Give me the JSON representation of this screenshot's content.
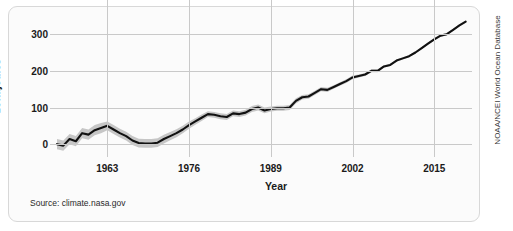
{
  "card": {
    "source_note": "Source: climate.nasa.gov",
    "credit_note": "NOAA/NCEI World Ocean Database"
  },
  "chart_data": {
    "type": "line",
    "title": "",
    "xlabel": "Year",
    "ylabel": "zettajoules",
    "xlim": [
      1955,
      2021
    ],
    "ylim": [
      -35,
      355
    ],
    "grid": true,
    "legend": "none",
    "xticks": [
      1963,
      1976,
      1989,
      2002,
      2015
    ],
    "xtick_labels": [
      "1963",
      "1976",
      "1989",
      "2002",
      "2015"
    ],
    "yticks": [
      0,
      100,
      200,
      300
    ],
    "ytick_labels": [
      "0",
      "100",
      "200",
      "300"
    ],
    "series": [
      {
        "name": "Ocean heat content",
        "color": "#111111",
        "x": [
          1955,
          1956,
          1957,
          1958,
          1959,
          1960,
          1961,
          1962,
          1963,
          1964,
          1965,
          1966,
          1967,
          1968,
          1969,
          1970,
          1971,
          1972,
          1973,
          1974,
          1975,
          1976,
          1977,
          1978,
          1979,
          1980,
          1981,
          1982,
          1983,
          1984,
          1985,
          1986,
          1987,
          1988,
          1989,
          1990,
          1991,
          1992,
          1993,
          1994,
          1995,
          1996,
          1997,
          1998,
          1999,
          2000,
          2001,
          2002,
          2003,
          2004,
          2005,
          2006,
          2007,
          2008,
          2009,
          2010,
          2011,
          2012,
          2013,
          2014,
          2015,
          2016,
          2017,
          2018,
          2019,
          2020
        ],
        "values": [
          0,
          -4,
          14,
          8,
          30,
          26,
          38,
          44,
          50,
          40,
          30,
          22,
          10,
          3,
          2,
          2,
          4,
          14,
          22,
          30,
          40,
          52,
          62,
          72,
          82,
          80,
          76,
          74,
          84,
          82,
          86,
          96,
          100,
          92,
          96,
          98,
          98,
          100,
          118,
          128,
          130,
          140,
          150,
          148,
          156,
          164,
          172,
          182,
          186,
          190,
          200,
          200,
          212,
          216,
          228,
          234,
          240,
          250,
          262,
          274,
          286,
          296,
          300,
          312,
          324,
          334
        ]
      }
    ],
    "uncertainty_band": {
      "name": "uncertainty",
      "color": "#c6c6c6",
      "upper": [
        14,
        10,
        28,
        22,
        44,
        40,
        52,
        58,
        62,
        52,
        42,
        34,
        22,
        15,
        14,
        14,
        16,
        26,
        33,
        41,
        50,
        62,
        71,
        81,
        90,
        88,
        84,
        82,
        92,
        90,
        94,
        104,
        108,
        100,
        103,
        105,
        105,
        107,
        125,
        134,
        136,
        146,
        156,
        154,
        161,
        169,
        177,
        187,
        190,
        194,
        204,
        204,
        215,
        219,
        231,
        237,
        243,
        253,
        265,
        277,
        289,
        299,
        303,
        315,
        327,
        337
      ],
      "lower": [
        -14,
        -18,
        0,
        -6,
        16,
        12,
        24,
        30,
        38,
        28,
        18,
        10,
        -2,
        -9,
        -10,
        -10,
        -8,
        2,
        11,
        19,
        30,
        42,
        53,
        63,
        74,
        72,
        68,
        66,
        76,
        74,
        78,
        88,
        92,
        84,
        89,
        91,
        91,
        93,
        111,
        122,
        124,
        134,
        144,
        142,
        151,
        159,
        167,
        177,
        182,
        186,
        196,
        196,
        209,
        213,
        225,
        231,
        237,
        247,
        259,
        271,
        283,
        293,
        297,
        309,
        321,
        331
      ]
    }
  }
}
